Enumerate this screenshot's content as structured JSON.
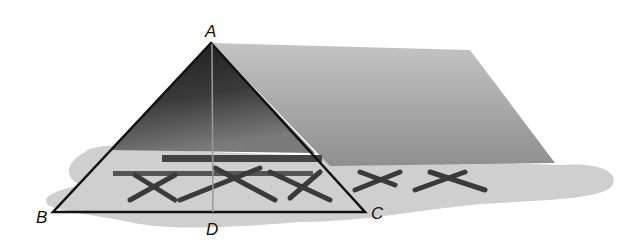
{
  "figure": {
    "labels": {
      "A": "A",
      "B": "B",
      "C": "C",
      "D": "D"
    },
    "points": {
      "A": [
        211,
        43
      ],
      "B": [
        53,
        212
      ],
      "C": [
        365,
        212
      ],
      "D": [
        213,
        212
      ]
    },
    "segments": [
      "AB",
      "AC",
      "BC",
      "AD"
    ],
    "colors": {
      "roof_side": "#a9a9a9",
      "tent_front_dark": "#2a2a2a",
      "shadow": "#cfcfcf",
      "line": "#111111",
      "altitude": "#9a9a9a"
    }
  }
}
